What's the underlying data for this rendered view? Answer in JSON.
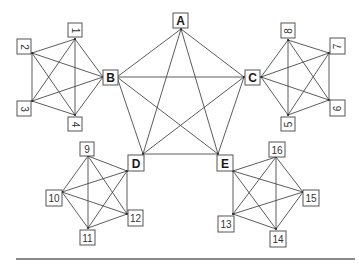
{
  "diagram": {
    "title": "",
    "colors": {
      "edge": "#4a4a4a",
      "box_stroke": "#555555",
      "text": "#333333",
      "rule": "#8a8a8a"
    },
    "major_nodes": [
      {
        "id": "A",
        "label": "A",
        "box": [
          173,
          13,
          15,
          15
        ]
      },
      {
        "id": "B",
        "label": "B",
        "box": [
          103,
          70,
          15,
          15
        ]
      },
      {
        "id": "C",
        "label": "C",
        "box": [
          245,
          70,
          15,
          15
        ]
      },
      {
        "id": "D",
        "label": "D",
        "box": [
          128,
          155,
          16,
          16
        ]
      },
      {
        "id": "E",
        "label": "E",
        "box": [
          217,
          155,
          16,
          16
        ]
      }
    ],
    "minor_nodes": [
      {
        "id": "1",
        "label": "1",
        "box": [
          68,
          23,
          14,
          14
        ],
        "rotate": 90
      },
      {
        "id": "2",
        "label": "2",
        "box": [
          17,
          39,
          14,
          15
        ],
        "rotate": 90
      },
      {
        "id": "3",
        "label": "3",
        "box": [
          17,
          101,
          14,
          15
        ],
        "rotate": 90
      },
      {
        "id": "4",
        "label": "4",
        "box": [
          68,
          117,
          14,
          14
        ],
        "rotate": 90
      },
      {
        "id": "5",
        "label": "5",
        "box": [
          281,
          117,
          14,
          14
        ],
        "rotate": -90
      },
      {
        "id": "6",
        "label": "6",
        "box": [
          330,
          100,
          15,
          16
        ],
        "rotate": -90
      },
      {
        "id": "7",
        "label": "7",
        "box": [
          330,
          38,
          15,
          16
        ],
        "rotate": -90
      },
      {
        "id": "8",
        "label": "8",
        "box": [
          281,
          23,
          14,
          15
        ],
        "rotate": -90
      },
      {
        "id": "9",
        "label": "9",
        "box": [
          80,
          142,
          14,
          14
        ],
        "rotate": 0
      },
      {
        "id": "10",
        "label": "10",
        "box": [
          46,
          190,
          16,
          16
        ],
        "rotate": 0
      },
      {
        "id": "11",
        "label": "11",
        "box": [
          80,
          230,
          15,
          15
        ],
        "rotate": 0
      },
      {
        "id": "12",
        "label": "12",
        "box": [
          128,
          210,
          15,
          16
        ],
        "rotate": 0
      },
      {
        "id": "13",
        "label": "13",
        "box": [
          218,
          216,
          16,
          16
        ],
        "rotate": 0
      },
      {
        "id": "14",
        "label": "14",
        "box": [
          270,
          231,
          16,
          16
        ],
        "rotate": 0
      },
      {
        "id": "15",
        "label": "15",
        "box": [
          303,
          190,
          16,
          16
        ],
        "rotate": 0
      },
      {
        "id": "16",
        "label": "16",
        "box": [
          269,
          142,
          16,
          15
        ],
        "rotate": 0
      }
    ],
    "clusters": [
      {
        "name": "B-cluster",
        "points": [
          [
            75,
            39
          ],
          [
            32,
            53
          ],
          [
            32,
            101
          ],
          [
            75,
            115
          ],
          [
            103,
            77
          ]
        ],
        "labels": [
          "1",
          "2",
          "3",
          "4",
          "B"
        ]
      },
      {
        "name": "C-cluster",
        "points": [
          [
            288,
            40
          ],
          [
            329,
            53
          ],
          [
            329,
            100
          ],
          [
            288,
            115
          ],
          [
            261,
            77
          ]
        ],
        "labels": [
          "8",
          "7",
          "6",
          "5",
          "C"
        ]
      },
      {
        "name": "D-cluster",
        "points": [
          [
            88,
            156
          ],
          [
            62,
            192
          ],
          [
            88,
            228
          ],
          [
            127,
            214
          ],
          [
            127,
            171
          ]
        ],
        "labels": [
          "9",
          "10",
          "11",
          "12",
          "D"
        ]
      },
      {
        "name": "E-cluster",
        "points": [
          [
            276,
            157
          ],
          [
            303,
            192
          ],
          [
            276,
            229
          ],
          [
            233,
            214
          ],
          [
            233,
            171
          ]
        ],
        "labels": [
          "16",
          "15",
          "14",
          "13",
          "E"
        ]
      },
      {
        "name": "main-pentagon",
        "points": [
          [
            181,
            29
          ],
          [
            117,
            77
          ],
          [
            244,
            77
          ],
          [
            143,
            154
          ],
          [
            218,
            154
          ]
        ],
        "labels": [
          "A",
          "B",
          "C",
          "D",
          "E"
        ]
      }
    ],
    "bottom_rule": {
      "x1": 16,
      "x2": 355,
      "y": 259
    }
  }
}
